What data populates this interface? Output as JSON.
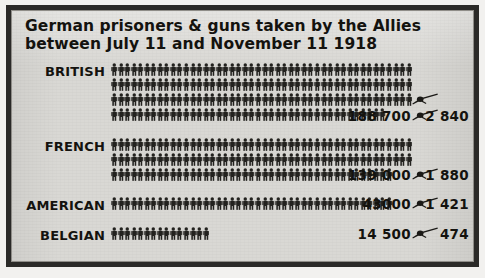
{
  "frame": {
    "background_color": "#d9d8d4",
    "border_color": "#2b2a28"
  },
  "title": {
    "line1": "German prisoners & guns taken by the Allies",
    "line2": "between July 11 and November 11 1918"
  },
  "symbols": {
    "person_icon": "person-pictogram",
    "gun_icon": "field-gun-pictogram",
    "person_color": "#23221f",
    "gun_color": "#1b1a17"
  },
  "chart_data": {
    "type": "bar",
    "title": "German prisoners & guns taken by the Allies between July 11 and November 11 1918",
    "subtitle": "",
    "xlabel": "",
    "ylabel": "",
    "categories": [
      "BRITISH",
      "FRENCH",
      "AMERICAN",
      "BELGIAN"
    ],
    "series": [
      {
        "name": "Prisoners",
        "values": [
          188700,
          139000,
          43000,
          14500
        ]
      },
      {
        "name": "Guns",
        "values": [
          2840,
          1880,
          1421,
          474
        ]
      }
    ],
    "unit_note": "Each person pictogram represents roughly 1000 prisoners; each gun pictogram roughly 1000 guns",
    "grid": false,
    "legend": "none"
  },
  "rows": [
    {
      "label": "BRITISH",
      "prisoners_label": "188 700",
      "guns_label": "2 840",
      "prisoners_value": 188700,
      "guns_value": 2840,
      "person_rows": [
        46,
        46,
        46,
        42
      ],
      "gun_icons": 2
    },
    {
      "label": "FRENCH",
      "prisoners_label": "139 000",
      "guns_label": "1 880",
      "prisoners_value": 139000,
      "guns_value": 1880,
      "person_rows": [
        46,
        46,
        43
      ],
      "gun_icons": 1
    },
    {
      "label": "AMERICAN",
      "prisoners_label": "43000",
      "guns_label": "1 421",
      "prisoners_value": 43000,
      "guns_value": 1421,
      "person_rows": [
        43
      ],
      "gun_icons": 1
    },
    {
      "label": "BELGIAN",
      "prisoners_label": "14 500",
      "guns_label": "474",
      "prisoners_value": 14500,
      "guns_value": 474,
      "person_rows": [
        15
      ],
      "gun_icons": 1
    }
  ]
}
